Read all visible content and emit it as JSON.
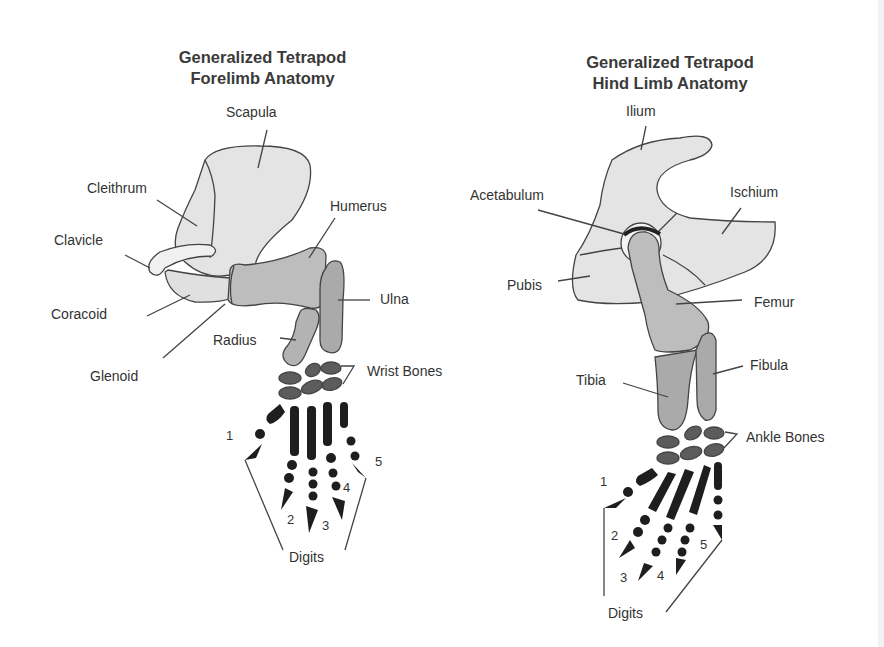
{
  "forelimb": {
    "title_line1": "Generalized Tetrapod",
    "title_line2": "Forelimb Anatomy",
    "labels": {
      "scapula": "Scapula",
      "cleithrum": "Cleithrum",
      "clavicle": "Clavicle",
      "humerus": "Humerus",
      "coracoid": "Coracoid",
      "ulna": "Ulna",
      "radius": "Radius",
      "glenoid": "Glenoid",
      "wrist_bones": "Wrist Bones",
      "digits": "Digits"
    },
    "digit_numbers": [
      "1",
      "2",
      "3",
      "4",
      "5"
    ]
  },
  "hindlimb": {
    "title_line1": "Generalized Tetrapod",
    "title_line2": "Hind Limb Anatomy",
    "labels": {
      "ilium": "Ilium",
      "acetabulum": "Acetabulum",
      "ischium": "Ischium",
      "pubis": "Pubis",
      "femur": "Femur",
      "tibia": "Tibia",
      "fibula": "Fibula",
      "ankle_bones": "Ankle Bones",
      "digits": "Digits"
    },
    "digit_numbers": [
      "1",
      "2",
      "3",
      "4",
      "5"
    ]
  },
  "colors": {
    "girdle_fill": "#e4e4e4",
    "long_bone_fill": "#bdbdbd",
    "lower_bone_fill": "#a9a9a9",
    "carpal_fill": "#5c5c5c",
    "phalanx_fill": "#1e1e1e",
    "outline": "#444444"
  }
}
